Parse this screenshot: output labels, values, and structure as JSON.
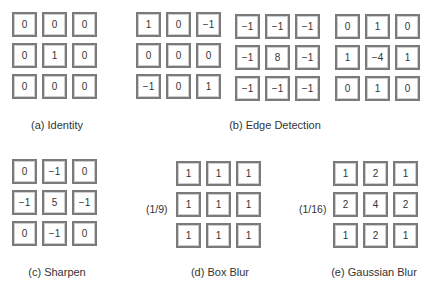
{
  "figure": {
    "kernels": [
      {
        "id": "identity",
        "cells": [
          "0",
          "0",
          "0",
          "0",
          "1",
          "0",
          "0",
          "0",
          "0"
        ]
      },
      {
        "id": "edge1",
        "cells": [
          "1",
          "0",
          "−1",
          "0",
          "0",
          "0",
          "−1",
          "0",
          "1"
        ]
      },
      {
        "id": "edge2",
        "cells": [
          "−1",
          "−1",
          "−1",
          "−1",
          "8",
          "−1",
          "−1",
          "−1",
          "−1"
        ]
      },
      {
        "id": "edge3",
        "cells": [
          "0",
          "1",
          "0",
          "1",
          "−4",
          "1",
          "0",
          "1",
          "0"
        ]
      },
      {
        "id": "sharpen",
        "cells": [
          "0",
          "−1",
          "0",
          "−1",
          "5",
          "−1",
          "0",
          "−1",
          "0"
        ]
      },
      {
        "id": "box_blur",
        "cells": [
          "1",
          "1",
          "1",
          "1",
          "1",
          "1",
          "1",
          "1",
          "1"
        ],
        "scale": "(1/9)"
      },
      {
        "id": "gaussian_blur",
        "cells": [
          "1",
          "2",
          "1",
          "2",
          "4",
          "2",
          "1",
          "2",
          "1"
        ],
        "scale": "(1/16)"
      }
    ],
    "captions": {
      "a": "(a) Identity",
      "b": "(b) Edge Detection",
      "c": "(c) Sharpen",
      "d": "(d) Box Blur",
      "e": "(e) Gaussian Blur"
    }
  }
}
